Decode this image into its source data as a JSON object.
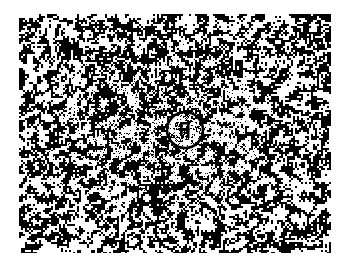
{
  "figure": {
    "kind": "binary-noise-field",
    "title": "",
    "canvas": {
      "width": 344,
      "height": 269,
      "background_color": "#ffffff"
    },
    "noise_field": {
      "x": 19,
      "y": 14,
      "width": 312,
      "height": 239,
      "description": "High-contrast black and white random dither / noise pattern",
      "foreground_color": "#000000",
      "background_color": "#ffffff",
      "block_size_px": 2,
      "black_fraction": 0.5,
      "seed": 20240517,
      "smoothing_passes": 1
    },
    "annotations": [
      {
        "type": "circle",
        "name": "region-of-interest-circle",
        "label": "",
        "center_x": 166,
        "center_y": 116,
        "radius": 18,
        "stroke_color": "#000000",
        "stroke_width": 2.6,
        "style": "hand-drawn"
      }
    ]
  }
}
